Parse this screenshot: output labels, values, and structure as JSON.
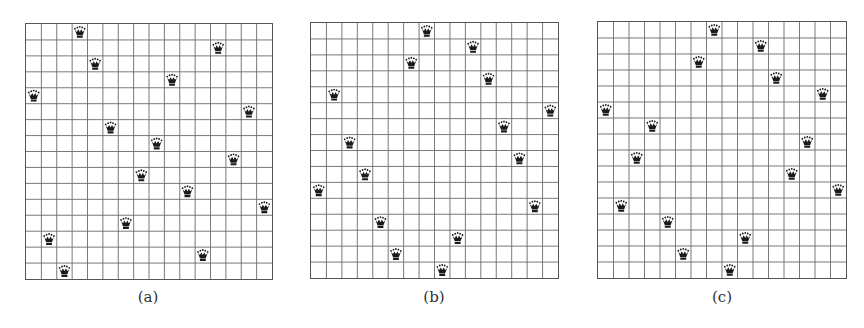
{
  "board_size": 16,
  "colors": {
    "grid": "#6a6a6a",
    "queen": "#1a1a1a",
    "background": "#ffffff"
  },
  "queen_icon": "crown-queen-icon",
  "boards": [
    {
      "id": "a",
      "caption": "(a)",
      "queens_col_by_row": [
        3,
        12,
        4,
        9,
        0,
        14,
        5,
        8,
        13,
        7,
        10,
        15,
        6,
        1,
        11,
        2
      ]
    },
    {
      "id": "b",
      "caption": "(b)",
      "queens_col_by_row": [
        7,
        10,
        6,
        11,
        1,
        15,
        12,
        2,
        13,
        3,
        0,
        14,
        4,
        9,
        5,
        8
      ]
    },
    {
      "id": "c",
      "caption": "(c)",
      "queens_col_by_row": [
        7,
        10,
        6,
        11,
        14,
        0,
        3,
        13,
        2,
        12,
        15,
        1,
        4,
        9,
        5,
        8
      ]
    }
  ]
}
